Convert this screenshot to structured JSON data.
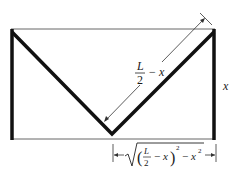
{
  "diagram": {
    "colors": {
      "stroke": "#111111",
      "thin": "#555555",
      "background": "#ffffff"
    },
    "labels": {
      "slant_numerator": "L",
      "slant_denominator": "2",
      "slant_minus": "−",
      "slant_var": "x",
      "height": "x",
      "bottom_L": "L",
      "bottom_2": "2",
      "bottom_minus1": "−",
      "bottom_x1": "x",
      "bottom_exp1": "2",
      "bottom_minus2": "−",
      "bottom_x2": "x",
      "bottom_exp2": "2"
    }
  }
}
